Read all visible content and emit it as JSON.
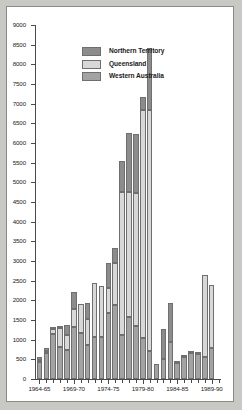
{
  "chart": {
    "type": "bar",
    "background": "#ffffff",
    "page_background": "#c8c8c4",
    "border_color": "#8a8a86"
  },
  "legend": {
    "position": "top-left-inside",
    "items": [
      {
        "label": "Northern Territory",
        "color": "#8c8c8c",
        "key": "nt"
      },
      {
        "label": "Queensland",
        "color": "#d8d8d8",
        "key": "qld"
      },
      {
        "label": "Western Australia",
        "color": "#a3a3a3",
        "key": "wa"
      }
    ]
  },
  "axes": {
    "y": {
      "min": 0,
      "max": 9000,
      "tick_step": 500,
      "labels": [
        "0",
        "500",
        "1000",
        "1500",
        "2000",
        "2500",
        "3000",
        "3500",
        "4000",
        "4500",
        "5000",
        "5500",
        "6000",
        "6500",
        "7000",
        "7500",
        "8000",
        "8500",
        "9000"
      ],
      "title": ""
    },
    "x": {
      "title": "",
      "tick_labels": [
        "1964-65",
        "1969-70",
        "1974-75",
        "1979-80",
        "1984-85",
        "1989-90"
      ],
      "tick_label_indices": [
        0,
        5,
        10,
        15,
        20,
        25
      ]
    }
  },
  "chart_data": {
    "type": "bar",
    "subtype": "stacked-vertical",
    "title": "",
    "xlabel": "",
    "ylabel": "",
    "ylim": [
      0,
      9000
    ],
    "ytick_step": 500,
    "grid": false,
    "legend_position": "upper left (inside plot area)",
    "categories": [
      "1964-65",
      "1965-66",
      "1966-67",
      "1967-68",
      "1968-69",
      "1969-70",
      "1970-71",
      "1971-72",
      "1972-73",
      "1973-74",
      "1974-75",
      "1975-76",
      "1976-77",
      "1977-78",
      "1978-79",
      "1979-80",
      "1980-81",
      "1981-82",
      "1982-83",
      "1983-84",
      "1984-85",
      "1985-86",
      "1986-87",
      "1987-88",
      "1988-89",
      "1989-90",
      "1990-91"
    ],
    "series": [
      {
        "name": "Western Australia",
        "color": "#a3a3a3",
        "stack_order": 1,
        "values": [
          430,
          650,
          1180,
          840,
          750,
          1330,
          1160,
          860,
          1070,
          1060,
          1680,
          1870,
          1120,
          1570,
          1360,
          1050,
          720,
          390,
          520,
          940,
          440,
          600,
          680,
          660,
          560,
          780,
          0
        ]
      },
      {
        "name": "Queensland",
        "color": "#d8d8d8",
        "stack_order": 2,
        "values": [
          60,
          70,
          130,
          500,
          380,
          450,
          760,
          660,
          1380,
          1310,
          630,
          1090,
          3640,
          3180,
          3380,
          5780,
          6110,
          0,
          0,
          0,
          0,
          0,
          0,
          0,
          2080,
          1620,
          0
        ]
      },
      {
        "name": "Northern Territory",
        "color": "#8c8c8c",
        "stack_order": 3,
        "values": [
          60,
          60,
          20,
          20,
          250,
          440,
          0,
          420,
          0,
          0,
          650,
          370,
          780,
          1500,
          1490,
          350,
          1580,
          0,
          740,
          990,
          20,
          20,
          20,
          20,
          0,
          0,
          0
        ]
      }
    ],
    "totals": [
      550,
      780,
      1330,
      1360,
      1380,
      2220,
      1920,
      1940,
      2450,
      2370,
      2960,
      3330,
      5540,
      6250,
      6230,
      7180,
      8410,
      390,
      1260,
      1930,
      460,
      620,
      700,
      680,
      2640,
      2400,
      0
    ],
    "peak": {
      "category": "1980-81",
      "value": 8410
    }
  }
}
